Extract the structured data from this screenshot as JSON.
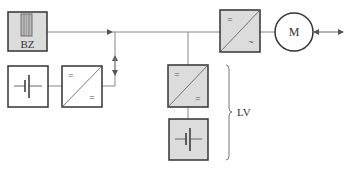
{
  "diagram": {
    "colors": {
      "line": "#888888",
      "box_border": "#333333",
      "gray_fill": "#dcdcdc",
      "white_fill": "#ffffff",
      "text": "#333333"
    },
    "nodes": {
      "fuel_cell": {
        "label": "BZ",
        "type": "fuel-cell",
        "fill": "gray"
      },
      "battery_left": {
        "label": "",
        "type": "battery",
        "fill": "white"
      },
      "converter_left": {
        "label": "",
        "type": "dc-dc-converter",
        "in_symbol": "=",
        "out_symbol": "=",
        "fill": "white"
      },
      "converter_mid": {
        "label": "",
        "type": "dc-dc-converter",
        "in_symbol": "=",
        "out_symbol": "=",
        "fill": "gray"
      },
      "battery_lower": {
        "label": "",
        "type": "battery",
        "fill": "gray"
      },
      "inverter": {
        "label": "",
        "type": "dc-ac-inverter",
        "in_symbol": "=",
        "out_symbol": "~",
        "fill": "gray"
      },
      "motor": {
        "label": "M",
        "type": "motor"
      }
    },
    "annotations": {
      "brace_label": "LV"
    }
  }
}
